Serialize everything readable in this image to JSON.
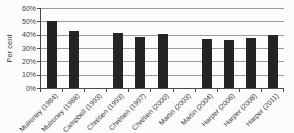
{
  "chart_data": {
    "type": "bar",
    "title": "",
    "ylabel": "Per cent",
    "xlabel": "",
    "ylim": [
      0,
      60
    ],
    "ytick_labels": [
      "0%",
      "10%",
      "20%",
      "30%",
      "40%",
      "50%",
      "60%"
    ],
    "grid": true,
    "legend_position": "none",
    "categories": [
      "Mulroney (1984)",
      "Mulroney (1988)",
      "Campbell (1993)",
      "Chrétien (1993)",
      "Chrétien (1997)",
      "Chrétien (2000)",
      "Martin (2003)",
      "Martin (2004)",
      "Harper (2006)",
      "Harper (2008)",
      "Harper (2011)"
    ],
    "values": [
      50,
      43,
      null,
      41.3,
      38.5,
      40.8,
      null,
      36.7,
      36.3,
      37.7,
      39.6
    ]
  },
  "colors": {
    "bar": "#242424",
    "gridline": "#9a9a9a",
    "axis": "#4a4a4a",
    "text": "#3a3a3a",
    "background": "#fcfcfb"
  }
}
